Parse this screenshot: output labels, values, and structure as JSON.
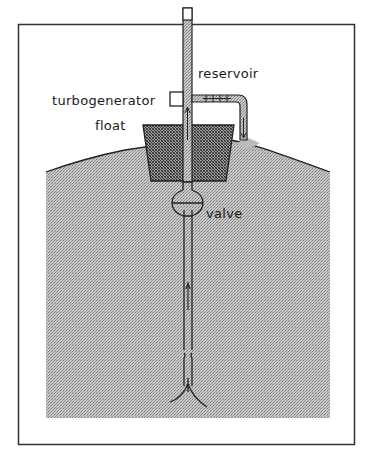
{
  "diagram": {
    "type": "schematic",
    "labels": {
      "reservoir": "reservoir",
      "turbogenerator": "turbogenerator",
      "float": "float",
      "valve": "valve"
    },
    "colors": {
      "frame": "#333333",
      "water": "#b9b9b9",
      "float": "#8a8a8a",
      "line": "#1a1a1a",
      "background": "#ffffff"
    }
  }
}
